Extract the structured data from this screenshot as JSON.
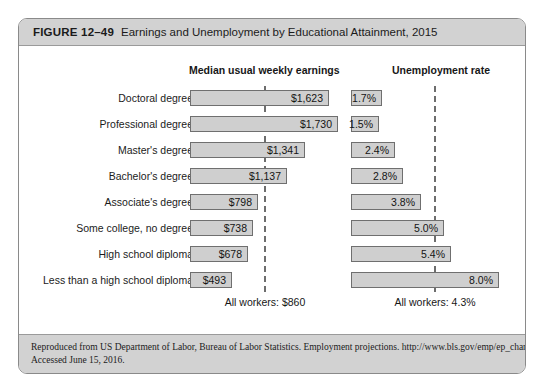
{
  "figure": {
    "number": "FIGURE 12–49",
    "title": "Earnings and Unemployment by Educational Attainment, 2015"
  },
  "headers": {
    "earnings": "Median usual weekly earnings",
    "unemployment": "Unemployment rate"
  },
  "averages": {
    "earnings_label": "All workers: $860",
    "unemployment_label": "All workers: 4.3%"
  },
  "source": {
    "line1": "Reproduced from US Department of Labor, Bureau of Labor Statistics. Employment projections.  http://www.bls.gov/emp/ep_chart_001.htm.",
    "line2": "Accessed June 15, 2016."
  },
  "chart_data": {
    "type": "bar",
    "title": "Earnings and Unemployment by Educational Attainment, 2015",
    "orientation": "horizontal",
    "categories": [
      "Doctoral degree",
      "Professional degree",
      "Master's degree",
      "Bachelor's degree",
      "Associate's degree",
      "Some college, no degree",
      "High school diploma",
      "Less than a high school diploma"
    ],
    "series": [
      {
        "name": "Median usual weekly earnings",
        "unit": "USD per week",
        "values": [
          1623,
          1730,
          1341,
          1137,
          798,
          738,
          678,
          493
        ],
        "labels": [
          "$1,623",
          "$1,730",
          "$1,341",
          "$1,137",
          "$798",
          "$738",
          "$678",
          "$493"
        ],
        "reference_line": {
          "value": 860,
          "label": "All workers: $860"
        },
        "axis_max": 1730
      },
      {
        "name": "Unemployment rate",
        "unit": "percent",
        "values": [
          1.7,
          1.5,
          2.4,
          2.8,
          3.8,
          5.0,
          5.4,
          8.0
        ],
        "labels": [
          "1.7%",
          "1.5%",
          "2.4%",
          "2.8%",
          "3.8%",
          "5.0%",
          "5.4%",
          "8.0%"
        ],
        "reference_line": {
          "value": 4.3,
          "label": "All workers: 4.3%"
        },
        "axis_max": 8.0
      }
    ],
    "xlabel": "",
    "ylabel": "",
    "grid": false,
    "legend": "none"
  },
  "colors": {
    "bar_fill": "#cfcfcf",
    "bar_border": "#6f6f6f",
    "band_background": "#d2d2d2",
    "dashed_line": "#6d6d6d"
  }
}
